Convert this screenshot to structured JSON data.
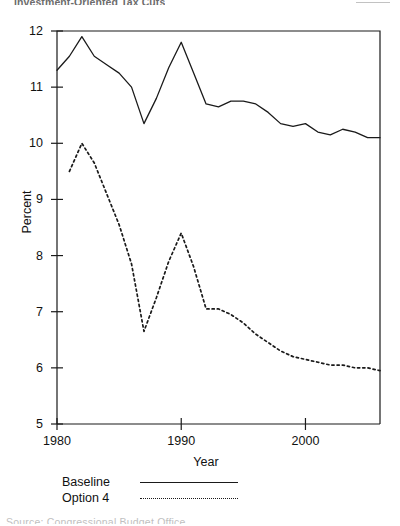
{
  "page": {
    "top_cropped_text": "Investment-Oriented Tax Cuts",
    "bottom_cropped_text": "Source: Congressional Budget Office"
  },
  "axes": {
    "y_title": "Percent",
    "x_title": "Year",
    "y_ticks": [
      "12",
      "11",
      "10",
      "9",
      "8",
      "7",
      "6",
      "5"
    ],
    "x_ticks": [
      "1980",
      "1990",
      "2000"
    ]
  },
  "legend": {
    "entries": [
      {
        "label": "Baseline",
        "style": "solid"
      },
      {
        "label": "Option 4",
        "style": "dashed"
      }
    ]
  },
  "chart_data": {
    "type": "line",
    "title": "Investment-Oriented Tax Cuts",
    "xlabel": "Year",
    "ylabel": "Percent",
    "xlim": [
      1980,
      2006
    ],
    "ylim": [
      5,
      12
    ],
    "grid": false,
    "legend_position": "below-axes-left",
    "x_ticks": [
      1980,
      1990,
      2000
    ],
    "y_ticks": [
      5,
      6,
      7,
      8,
      9,
      10,
      11,
      12
    ],
    "x": [
      1980,
      1981,
      1982,
      1983,
      1984,
      1985,
      1986,
      1987,
      1988,
      1989,
      1990,
      1991,
      1992,
      1993,
      1994,
      1995,
      1996,
      1997,
      1998,
      1999,
      2000,
      2001,
      2002,
      2003,
      2004,
      2005,
      2006
    ],
    "series": [
      {
        "name": "Baseline",
        "style": "solid",
        "color": "#1a1a1a",
        "values": [
          11.3,
          11.55,
          11.9,
          11.55,
          11.4,
          11.25,
          11.0,
          10.35,
          10.8,
          11.35,
          11.8,
          11.25,
          10.7,
          10.65,
          10.75,
          10.75,
          10.7,
          10.55,
          10.35,
          10.3,
          10.35,
          10.2,
          10.15,
          10.25,
          10.2,
          10.1,
          10.1
        ]
      },
      {
        "name": "Option 4",
        "style": "dashed",
        "color": "#1a1a1a",
        "values": [
          null,
          9.5,
          10.0,
          9.65,
          9.1,
          8.55,
          7.85,
          6.65,
          7.25,
          7.9,
          8.4,
          7.8,
          7.05,
          7.05,
          6.95,
          6.8,
          6.6,
          6.45,
          6.3,
          6.2,
          6.15,
          6.1,
          6.05,
          6.05,
          6.0,
          6.0,
          5.95
        ]
      }
    ]
  }
}
